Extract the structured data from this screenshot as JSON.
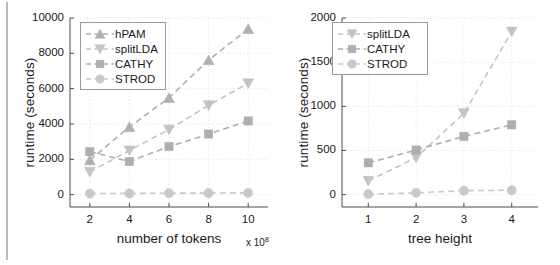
{
  "figure": {
    "background_color": "#ffffff",
    "axis_color": "#4d4d4d",
    "grid_color": "#d9d9d9",
    "text_color": "#1a1a1a"
  },
  "chart_data": [
    {
      "id": "left",
      "type": "line",
      "title": "",
      "xlabel": "number of tokens",
      "x_multiplier": "x 10",
      "x_multiplier_exponent": "8",
      "ylabel": "runtime (seconds)",
      "x": [
        2,
        4,
        6,
        8,
        10
      ],
      "xticks": [
        "2",
        "4",
        "6",
        "8",
        "10"
      ],
      "yticks": [
        "0",
        "2000",
        "4000",
        "6000",
        "8000",
        "10000"
      ],
      "xlim": [
        1,
        11
      ],
      "ylim": [
        -700,
        10000
      ],
      "grid": true,
      "legend_position": "top-left",
      "series": [
        {
          "name": "hPAM",
          "marker": "triangle-up",
          "color": "#b0b0b0",
          "values": [
            1950,
            3830,
            5480,
            7620,
            9380
          ]
        },
        {
          "name": "splitLDA",
          "marker": "triangle-down",
          "color": "#c4c4c4",
          "values": [
            1290,
            2500,
            3680,
            5060,
            6300
          ]
        },
        {
          "name": "CATHY",
          "marker": "square",
          "color": "#aeaeae",
          "values": [
            2430,
            1880,
            2720,
            3430,
            4170
          ]
        },
        {
          "name": "STROD",
          "marker": "circle",
          "color": "#c9c9c9",
          "values": [
            60,
            70,
            80,
            90,
            100
          ]
        }
      ]
    },
    {
      "id": "right",
      "type": "line",
      "title": "",
      "xlabel": "tree height",
      "ylabel": "runtime (seconds)",
      "x": [
        1,
        2,
        3,
        4
      ],
      "xticks": [
        "1",
        "2",
        "3",
        "4"
      ],
      "yticks": [
        "0",
        "500",
        "1000",
        "1500",
        "2000"
      ],
      "xlim": [
        0.45,
        4.55
      ],
      "ylim": [
        -140,
        2000
      ],
      "grid": true,
      "legend_position": "top-left",
      "series": [
        {
          "name": "splitLDA",
          "marker": "triangle-down",
          "color": "#c4c4c4",
          "values": [
            155,
            420,
            920,
            1845
          ]
        },
        {
          "name": "CATHY",
          "marker": "square",
          "color": "#aeaeae",
          "values": [
            360,
            505,
            660,
            790
          ]
        },
        {
          "name": "STROD",
          "marker": "circle",
          "color": "#c9c9c9",
          "values": [
            5,
            20,
            45,
            50
          ]
        }
      ]
    }
  ]
}
